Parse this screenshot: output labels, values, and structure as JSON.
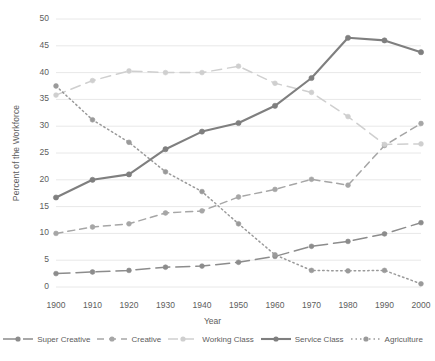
{
  "chart_data": {
    "type": "line",
    "title": "",
    "xlabel": "Year",
    "ylabel": "Percent of the Workforce",
    "x": [
      1900,
      1910,
      1920,
      1930,
      1940,
      1950,
      1960,
      1970,
      1980,
      1990,
      2000
    ],
    "xtick_labels": [
      "1900",
      "1910",
      "1920",
      "1930",
      "1940",
      "1950",
      "1960",
      "1970",
      "1980",
      "1990",
      "2000"
    ],
    "ytick_labels": [
      "0",
      "5",
      "10",
      "15",
      "20",
      "25",
      "30",
      "35",
      "40",
      "45",
      "50"
    ],
    "yticks": [
      0,
      5,
      10,
      15,
      20,
      25,
      30,
      35,
      40,
      45,
      50
    ],
    "ylim": [
      0,
      50
    ],
    "xlim": [
      1900,
      2000
    ],
    "grid": "horizontal",
    "legend_position": "bottom",
    "series": [
      {
        "name": "Super Creative",
        "color": "#8c8c8c",
        "dash": "14,6",
        "marker": "circle",
        "values": [
          2.5,
          2.8,
          3.1,
          3.7,
          3.9,
          4.6,
          5.7,
          7.6,
          8.5,
          9.9,
          12.0
        ]
      },
      {
        "name": "Creative",
        "color": "#a6a6a6",
        "dash": "7,5",
        "marker": "circle",
        "values": [
          10.0,
          11.2,
          11.8,
          13.8,
          14.2,
          16.8,
          18.2,
          20.1,
          19.0,
          26.4,
          30.5
        ]
      },
      {
        "name": "Working Class",
        "color": "#cfcfcf",
        "dash": "10,6",
        "marker": "circle",
        "values": [
          35.8,
          38.5,
          40.3,
          40.0,
          40.0,
          41.2,
          38.0,
          36.3,
          31.8,
          26.6,
          26.7
        ]
      },
      {
        "name": "Service Class",
        "color": "#7f7f7f",
        "dash": "none",
        "marker": "circle",
        "values": [
          16.7,
          20.0,
          21.0,
          25.7,
          29.0,
          30.6,
          33.8,
          39.0,
          46.5,
          46.0,
          43.8
        ]
      },
      {
        "name": "Agriculture",
        "color": "#9a9a9a",
        "dash": "1.5,3",
        "marker": "circle",
        "values": [
          37.5,
          31.2,
          27.0,
          21.5,
          17.8,
          11.8,
          6.0,
          3.1,
          3.0,
          3.1,
          0.6
        ]
      }
    ]
  },
  "axis": {
    "ylabel": "Percent of the Workforce",
    "xlabel": "Year"
  },
  "legend": {
    "items": [
      {
        "label": "Super Creative"
      },
      {
        "label": "Creative"
      },
      {
        "label": "Working Class"
      },
      {
        "label": "Service Class"
      },
      {
        "label": "Agriculture"
      }
    ]
  }
}
